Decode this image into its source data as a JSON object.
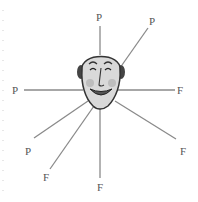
{
  "diagram": {
    "center": {
      "x": 101,
      "y": 82,
      "icon": "smiling-man-face-icon"
    },
    "colors": {
      "ray": "#8a8a8a",
      "label": "#555555",
      "face_skin": "#d9d9d9",
      "face_outline": "#333333",
      "cheek": "#b5b5b5"
    },
    "rays": [
      {
        "label": "P",
        "lx": 99,
        "ly": 21,
        "x1": 100,
        "y1": 55,
        "x2": 100,
        "y2": 26
      },
      {
        "label": "P",
        "lx": 152,
        "ly": 25,
        "x1": 122,
        "y1": 65,
        "x2": 148,
        "y2": 28
      },
      {
        "label": "P",
        "lx": 15,
        "ly": 94,
        "x1": 83,
        "y1": 90,
        "x2": 24,
        "y2": 90
      },
      {
        "label": "F",
        "lx": 180,
        "ly": 94,
        "x1": 118,
        "y1": 90,
        "x2": 175,
        "y2": 90
      },
      {
        "label": "P",
        "lx": 28,
        "ly": 155,
        "x1": 88,
        "y1": 101,
        "x2": 34,
        "y2": 138
      },
      {
        "label": "F",
        "lx": 46,
        "ly": 181,
        "x1": 94,
        "y1": 106,
        "x2": 50,
        "y2": 169
      },
      {
        "label": "F",
        "lx": 100,
        "ly": 191,
        "x1": 100,
        "y1": 108,
        "x2": 100,
        "y2": 178
      },
      {
        "label": "F",
        "lx": 183,
        "ly": 155,
        "x1": 115,
        "y1": 101,
        "x2": 176,
        "y2": 139
      }
    ]
  }
}
